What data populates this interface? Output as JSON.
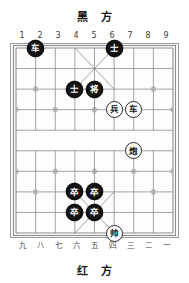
{
  "board": {
    "top_side_label": "黑 方",
    "bottom_side_label": "红 方",
    "top_coords": [
      "1",
      "2",
      "3",
      "4",
      "5",
      "6",
      "7",
      "8",
      "9"
    ],
    "bottom_coords": [
      "九",
      "八",
      "七",
      "六",
      "五",
      "四",
      "三",
      "二",
      "一"
    ],
    "files": 9,
    "ranks": 10,
    "colors": {
      "line": "#8c8c8c",
      "border": "#9a9a9a",
      "black_piece_bg": "#141414",
      "black_piece_fg": "#ffffff",
      "red_piece_bg": "#ffffff",
      "red_piece_fg": "#141414",
      "background": "#ffffff"
    },
    "pieces": [
      {
        "name": "black-chariot",
        "side": "black",
        "char": "车",
        "file": 2,
        "rank": 0
      },
      {
        "name": "black-advisor-1",
        "side": "black",
        "char": "士",
        "file": 6,
        "rank": 0
      },
      {
        "name": "black-advisor-2",
        "side": "black",
        "char": "士",
        "file": 4,
        "rank": 2
      },
      {
        "name": "black-general",
        "side": "black",
        "char": "将",
        "file": 5,
        "rank": 2
      },
      {
        "name": "red-soldier",
        "side": "red",
        "char": "兵",
        "file": 6,
        "rank": 3
      },
      {
        "name": "red-chariot",
        "side": "red",
        "char": "车",
        "file": 7,
        "rank": 3
      },
      {
        "name": "red-cannon",
        "side": "red",
        "char": "炮",
        "file": 7,
        "rank": 5
      },
      {
        "name": "black-soldier-1",
        "side": "black",
        "char": "卒",
        "file": 4,
        "rank": 7
      },
      {
        "name": "black-soldier-2",
        "side": "black",
        "char": "卒",
        "file": 5,
        "rank": 7
      },
      {
        "name": "black-soldier-3",
        "side": "black",
        "char": "卒",
        "file": 4,
        "rank": 8
      },
      {
        "name": "black-soldier-4",
        "side": "black",
        "char": "卒",
        "file": 5,
        "rank": 8
      },
      {
        "name": "red-general",
        "side": "red",
        "char": "帅",
        "file": 6,
        "rank": 9
      }
    ],
    "star_points": [
      {
        "file": 2,
        "rank": 2
      },
      {
        "file": 8,
        "rank": 2
      },
      {
        "file": 1,
        "rank": 3
      },
      {
        "file": 3,
        "rank": 3
      },
      {
        "file": 5,
        "rank": 3
      },
      {
        "file": 7,
        "rank": 3
      },
      {
        "file": 9,
        "rank": 3
      },
      {
        "file": 1,
        "rank": 6
      },
      {
        "file": 3,
        "rank": 6
      },
      {
        "file": 5,
        "rank": 6
      },
      {
        "file": 7,
        "rank": 6
      },
      {
        "file": 9,
        "rank": 6
      },
      {
        "file": 2,
        "rank": 7
      },
      {
        "file": 8,
        "rank": 7
      }
    ]
  }
}
